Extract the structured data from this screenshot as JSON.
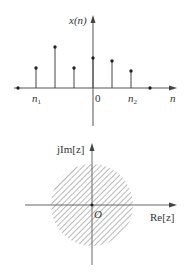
{
  "stem_plot": {
    "y_label": "x(n)",
    "x_label": "n",
    "origin_label": "0",
    "n1_label": "n",
    "n1_sub": "1",
    "n2_label": "n",
    "n2_sub": "2",
    "axis_color": "#555555",
    "stems": [
      {
        "x": 18,
        "height": 0
      },
      {
        "x": 36,
        "height": 20
      },
      {
        "x": 55,
        "height": 41
      },
      {
        "x": 74,
        "height": 20
      },
      {
        "x": 93,
        "height": 30
      },
      {
        "x": 112,
        "height": 27
      },
      {
        "x": 131,
        "height": 17
      },
      {
        "x": 150,
        "height": 0
      }
    ]
  },
  "z_plane": {
    "y_label": "jIm[z]",
    "x_label": "Re[z]",
    "origin_label": "O",
    "region": "hatched disc centered at origin",
    "hatch_color": "#888888"
  },
  "chart_data": [
    {
      "type": "stem",
      "title": "",
      "xlabel": "n",
      "ylabel": "x(n)",
      "tick_labels": [
        "n1",
        "0",
        "n2"
      ],
      "x": [
        "n1-1",
        "n1",
        "n1+1",
        "n1+2",
        "0",
        "1",
        "n2",
        "n2+1"
      ],
      "values": [
        0,
        2.0,
        4.1,
        2.0,
        3.0,
        2.7,
        1.7,
        0
      ],
      "notes": "finite-length sequence nonzero only for n1 <= n <= n2"
    },
    {
      "type": "region",
      "title": "",
      "xlabel": "Re[z]",
      "ylabel": "jIm[z]",
      "origin_label": "O",
      "region": "disc (hatched) centered at origin — region of convergence"
    }
  ]
}
